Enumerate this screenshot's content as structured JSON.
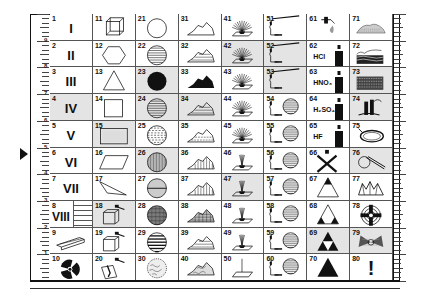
{
  "ruler": {
    "left_labels": [
      "9",
      "8",
      "7",
      "6",
      "5",
      "4",
      "3",
      "2",
      "1"
    ],
    "right_labels": [
      "9",
      "8",
      "7",
      "6",
      "5",
      "4",
      "3",
      "2",
      "1"
    ]
  },
  "cells": [
    {
      "n": "1",
      "kind": "roman",
      "text": "I",
      "shaded": false
    },
    {
      "n": "2",
      "kind": "roman",
      "text": "II",
      "shaded": false
    },
    {
      "n": "3",
      "kind": "roman",
      "text": "III",
      "shaded": false
    },
    {
      "n": "4",
      "kind": "roman",
      "text": "IV",
      "shaded": true
    },
    {
      "n": "5",
      "kind": "roman",
      "text": "V",
      "shaded": false
    },
    {
      "n": "6",
      "kind": "roman",
      "text": "VI",
      "shaded": false
    },
    {
      "n": "7",
      "kind": "roman",
      "text": "VII",
      "shaded": false
    },
    {
      "n": "8",
      "kind": "roman8",
      "text": "VIII",
      "shaded": false
    },
    {
      "n": "9",
      "kind": "icon",
      "icon": "beam-icon",
      "shaded": false
    },
    {
      "n": "10",
      "kind": "icon",
      "icon": "radiation-icon",
      "shaded": false
    },
    {
      "n": "11",
      "kind": "icon",
      "icon": "cube-icon",
      "shaded": false
    },
    {
      "n": "12",
      "kind": "icon",
      "icon": "hexagon-icon",
      "shaded": false
    },
    {
      "n": "13",
      "kind": "icon",
      "icon": "triangle-outline-icon",
      "shaded": false
    },
    {
      "n": "14",
      "kind": "icon",
      "icon": "square-icon",
      "shaded": false
    },
    {
      "n": "15",
      "kind": "icon",
      "icon": "rectangle-icon",
      "shaded": true
    },
    {
      "n": "16",
      "kind": "icon",
      "icon": "parallelogram-icon",
      "shaded": false
    },
    {
      "n": "17",
      "kind": "icon",
      "icon": "scalene-triangle-icon",
      "shaded": false
    },
    {
      "n": "18",
      "kind": "icon",
      "icon": "box-hammer-icon",
      "shaded": true
    },
    {
      "n": "19",
      "kind": "icon",
      "icon": "box-hammer-icon",
      "shaded": false
    },
    {
      "n": "20",
      "kind": "icon",
      "icon": "box-hammer-broken-icon",
      "shaded": false
    },
    {
      "n": "21",
      "kind": "icon",
      "icon": "circle-empty-icon",
      "shaded": false
    },
    {
      "n": "22",
      "kind": "icon",
      "icon": "circle-horizontal-lines-icon",
      "shaded": false
    },
    {
      "n": "23",
      "kind": "icon",
      "icon": "circle-filled-icon",
      "shaded": true
    },
    {
      "n": "24",
      "kind": "icon",
      "icon": "circle-horizontal-lines-icon",
      "shaded": true
    },
    {
      "n": "25",
      "kind": "icon",
      "icon": "circle-dashed-lines-icon",
      "shaded": false
    },
    {
      "n": "26",
      "kind": "icon",
      "icon": "circle-vertical-lines-icon",
      "shaded": true
    },
    {
      "n": "27",
      "kind": "icon",
      "icon": "circle-split-icon",
      "shaded": false
    },
    {
      "n": "28",
      "kind": "icon",
      "icon": "circle-crosshatch-icon",
      "shaded": false
    },
    {
      "n": "29",
      "kind": "icon",
      "icon": "circle-thick-lines-icon",
      "shaded": false
    },
    {
      "n": "30",
      "kind": "icon",
      "icon": "circle-texture-icon",
      "shaded": false
    },
    {
      "n": "31",
      "kind": "icon",
      "icon": "mountain-outline-icon",
      "shaded": false
    },
    {
      "n": "32",
      "kind": "icon",
      "icon": "mountain-lines-icon",
      "shaded": false
    },
    {
      "n": "33",
      "kind": "icon",
      "icon": "mountain-filled-icon",
      "shaded": false
    },
    {
      "n": "34",
      "kind": "icon",
      "icon": "mountain-lines-icon",
      "shaded": true
    },
    {
      "n": "35",
      "kind": "icon",
      "icon": "mountain-dashed-icon",
      "shaded": false
    },
    {
      "n": "36",
      "kind": "icon",
      "icon": "mountain-vertical-icon",
      "shaded": false
    },
    {
      "n": "37",
      "kind": "icon",
      "icon": "mountain-vertical-icon",
      "shaded": false
    },
    {
      "n": "38",
      "kind": "icon",
      "icon": "mountain-crosshatch-icon",
      "shaded": false
    },
    {
      "n": "39",
      "kind": "icon",
      "icon": "mountain-lines-icon",
      "shaded": false
    },
    {
      "n": "40",
      "kind": "icon",
      "icon": "mountain-texture-icon",
      "shaded": false
    },
    {
      "n": "41",
      "kind": "icon",
      "icon": "light-fan-icon",
      "shaded": false
    },
    {
      "n": "42",
      "kind": "icon",
      "icon": "light-fan-icon",
      "shaded": true
    },
    {
      "n": "43",
      "kind": "icon",
      "icon": "light-fan-icon",
      "shaded": false
    },
    {
      "n": "44",
      "kind": "icon",
      "icon": "light-fan-icon",
      "shaded": false
    },
    {
      "n": "45",
      "kind": "icon",
      "icon": "light-fan-icon",
      "shaded": false
    },
    {
      "n": "46",
      "kind": "icon",
      "icon": "light-narrow-icon",
      "shaded": false
    },
    {
      "n": "47",
      "kind": "icon",
      "icon": "light-narrow-icon",
      "shaded": true
    },
    {
      "n": "48",
      "kind": "icon",
      "icon": "light-narrow-icon",
      "shaded": false
    },
    {
      "n": "49",
      "kind": "icon",
      "icon": "light-narrow-icon",
      "shaded": false
    },
    {
      "n": "50",
      "kind": "icon",
      "icon": "light-single-icon",
      "shaded": false
    },
    {
      "n": "51",
      "kind": "icon",
      "icon": "burner-rod-icon",
      "shaded": false
    },
    {
      "n": "52",
      "kind": "icon",
      "icon": "burner-rod-icon",
      "shaded": true
    },
    {
      "n": "53",
      "kind": "icon",
      "icon": "burner-rod-icon",
      "shaded": true
    },
    {
      "n": "54",
      "kind": "icon",
      "icon": "burner-sphere-icon",
      "shaded": false
    },
    {
      "n": "55",
      "kind": "icon",
      "icon": "burner-sphere-icon",
      "shaded": false
    },
    {
      "n": "56",
      "kind": "icon",
      "icon": "burner-sphere-icon",
      "shaded": false
    },
    {
      "n": "57",
      "kind": "icon",
      "icon": "burner-sphere-icon",
      "shaded": false
    },
    {
      "n": "58",
      "kind": "icon",
      "icon": "burner-sphere-icon",
      "shaded": false
    },
    {
      "n": "59",
      "kind": "icon",
      "icon": "burner-sphere-icon",
      "shaded": false
    },
    {
      "n": "60",
      "kind": "icon",
      "icon": "burner-sphere-icon",
      "shaded": false
    },
    {
      "n": "61",
      "kind": "icon",
      "icon": "dropper-icon",
      "shaded": false
    },
    {
      "n": "62",
      "kind": "chem",
      "text": "HCl",
      "shaded": false
    },
    {
      "n": "63",
      "kind": "chem",
      "text": "HNO₃",
      "shaded": false
    },
    {
      "n": "64",
      "kind": "chem",
      "text": "H₂SO₄",
      "shaded": false
    },
    {
      "n": "65",
      "kind": "chem",
      "text": "HF",
      "shaded": false
    },
    {
      "n": "66",
      "kind": "icon",
      "icon": "cross-icon",
      "shaded": false
    },
    {
      "n": "67",
      "kind": "icon",
      "icon": "triangle-top-icon",
      "shaded": false
    },
    {
      "n": "68",
      "kind": "icon",
      "icon": "triangle-corners-icon",
      "shaded": false
    },
    {
      "n": "69",
      "kind": "icon",
      "icon": "triangle-sierpinski-icon",
      "shaded": true
    },
    {
      "n": "70",
      "kind": "icon",
      "icon": "triangle-filled-icon",
      "shaded": false
    },
    {
      "n": "71",
      "kind": "icon",
      "icon": "heap-icon",
      "shaded": false
    },
    {
      "n": "72",
      "kind": "icon",
      "icon": "layers-icon",
      "shaded": false
    },
    {
      "n": "73",
      "kind": "icon",
      "icon": "stack-icon",
      "shaded": true
    },
    {
      "n": "74",
      "kind": "icon",
      "icon": "pipes-icon",
      "shaded": true
    },
    {
      "n": "75",
      "kind": "icon",
      "icon": "ring-icon",
      "shaded": false
    },
    {
      "n": "76",
      "kind": "icon",
      "icon": "loop-tool-icon",
      "shaded": true
    },
    {
      "n": "77",
      "kind": "icon",
      "icon": "crystals-icon",
      "shaded": false
    },
    {
      "n": "78",
      "kind": "icon",
      "icon": "target-cross-icon",
      "shaded": false
    },
    {
      "n": "79",
      "kind": "icon",
      "icon": "butterfly-icon",
      "shaded": true
    },
    {
      "n": "80",
      "kind": "bang",
      "text": "!",
      "shaded": false
    }
  ]
}
